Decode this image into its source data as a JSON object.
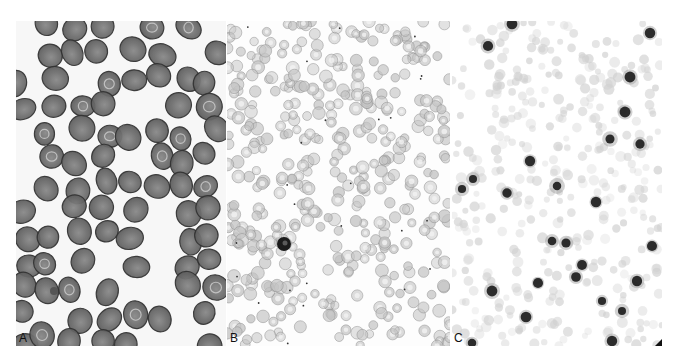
{
  "figure": {
    "panels": [
      {
        "id": "A",
        "label": "A",
        "description": "Blood smear with large, densely stained discoid red blood cells",
        "background": "#f7f7f7",
        "cell_fill": "#5a5a5a",
        "cell_rim": "#333333"
      },
      {
        "id": "B",
        "label": "B",
        "description": "Blood smear with many small pale ring-like red cells and a dark leukocyte",
        "background": "#fdfdfd",
        "cell_fill": "#c4c4c4",
        "cell_rim": "#8c8c8c"
      },
      {
        "id": "C",
        "label": "C",
        "description": "Blood smear with faint pale cells and scattered dark nuclei",
        "background": "#ffffff",
        "cell_fill": "#d0d0d0",
        "dark_fill": "#1a1a1a"
      }
    ]
  }
}
